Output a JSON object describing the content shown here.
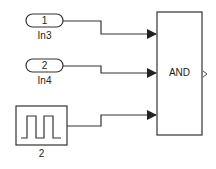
{
  "diagram": {
    "blocks": [
      {
        "id": "in3",
        "type": "inport",
        "port_number": "1",
        "label": "In3"
      },
      {
        "id": "in4",
        "type": "inport",
        "port_number": "2",
        "label": "In4"
      },
      {
        "id": "pulse",
        "type": "pulse-generator",
        "label": "2"
      },
      {
        "id": "and",
        "type": "logical-operator",
        "operator": "AND"
      }
    ],
    "connections": [
      {
        "from": "in3",
        "to": "and",
        "port": 1
      },
      {
        "from": "in4",
        "to": "and",
        "port": 2
      },
      {
        "from": "pulse",
        "to": "and",
        "port": 3
      }
    ],
    "colors": {
      "line": "#333333",
      "block_border": "#333333",
      "background": "#ffffff"
    }
  }
}
